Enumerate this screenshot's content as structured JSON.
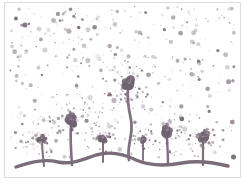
{
  "artwork": {
    "title": "Dandelions with blowing seeds",
    "medium": "ink illustration",
    "canvas": {
      "width": 245,
      "height": 182
    },
    "palette": {
      "background": "#ffffff",
      "frame_border": "#dcdcdc",
      "ink_dark": "#6f6370",
      "ink_mid": "#80717e",
      "ink_light": "#a99fa8",
      "ink_faint": "#c9c3cb"
    },
    "frame": {
      "x": 4,
      "y": 2,
      "width": 237,
      "height": 176
    },
    "ground_line": {
      "name": "undulating-ground",
      "path": "M 16 167 C 34 161 46 159 58 162 C 72 165 84 159 96 155 C 110 151 124 154 136 160 C 150 166 166 166 182 163 C 198 160 212 162 228 166",
      "stroke": "#7a6d79",
      "stroke_width": 3.4
    },
    "plants": [
      {
        "name": "dandelion-small-left",
        "stem": "M 44 166 C 43 156 42 148 42 141",
        "head": {
          "cx": 42,
          "cy": 139,
          "r": 3.4
        },
        "puff_radius": 19,
        "puff_seeds": 30,
        "stroke_width": 2.1
      },
      {
        "name": "dandelion-tall-left",
        "stem": "M 72 165 C 71 152 70 138 71 124",
        "head": {
          "cx": 71,
          "cy": 120,
          "r": 5.2
        },
        "puff_radius": 26,
        "puff_seeds": 46,
        "stroke_width": 2.6
      },
      {
        "name": "dandelion-short-center-left",
        "stem": "M 103 162 C 103 152 103 146 103 141",
        "head": {
          "cx": 103,
          "cy": 138,
          "r": 3.8
        },
        "puff_radius": 16,
        "puff_seeds": 24,
        "stroke_width": 2.0
      },
      {
        "name": "dandelion-tall-center",
        "stem": "M 129 160 C 126 147 134 134 131 120 C 128 106 127 96 128 88",
        "head": {
          "cx": 129,
          "cy": 84,
          "r": 6.0
        },
        "puff_radius": 30,
        "puff_seeds": 56,
        "stroke_width": 2.8
      },
      {
        "name": "dandelion-bud-center-right",
        "stem": "M 143 160 C 143 152 143 146 143 142",
        "head": {
          "cx": 143,
          "cy": 140,
          "r": 2.6
        },
        "puff_radius": 12,
        "puff_seeds": 16,
        "stroke_width": 1.9
      },
      {
        "name": "dandelion-right",
        "stem": "M 168 164 C 168 152 167 142 167 134",
        "head": {
          "cx": 167,
          "cy": 131,
          "r": 5.0
        },
        "puff_radius": 24,
        "puff_seeds": 40,
        "stroke_width": 2.4
      },
      {
        "name": "dandelion-far-right",
        "stem": "M 203 165 C 203 154 203 146 203 140",
        "head": {
          "cx": 203,
          "cy": 137,
          "r": 4.6
        },
        "puff_radius": 22,
        "puff_seeds": 36,
        "stroke_width": 2.3
      }
    ],
    "seed_field": {
      "name": "floating-seed-dots",
      "count": 430,
      "region": {
        "x": 10,
        "y": 6,
        "width": 225,
        "height": 152
      },
      "radius_range": [
        0.4,
        2.6
      ],
      "opacity_range": [
        0.18,
        0.95
      ]
    }
  }
}
